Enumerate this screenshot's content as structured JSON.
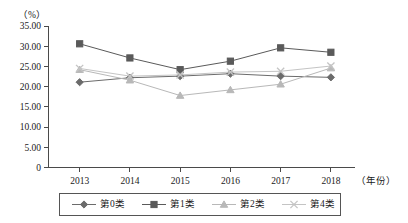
{
  "chart_data": {
    "type": "line",
    "title": "",
    "xlabel": "(年份)",
    "ylabel": "（%）",
    "categories": [
      "2013",
      "2014",
      "2015",
      "2016",
      "2017",
      "2018"
    ],
    "ylim": [
      0,
      35
    ],
    "y_ticks": [
      "0",
      "5.00",
      "10.00",
      "15.00",
      "20.00",
      "25.00",
      "30.00",
      "35.00"
    ],
    "y_tick_values": [
      0,
      5,
      10,
      15,
      20,
      25,
      30,
      35
    ],
    "grid": false,
    "legend_position": "bottom",
    "series": [
      {
        "name": "第0类",
        "marker": "diamond",
        "color": "#6b6b6b",
        "values": [
          21.1,
          22.2,
          22.6,
          23.2,
          22.6,
          22.3
        ]
      },
      {
        "name": "第1类",
        "marker": "square",
        "color": "#5a5a5a",
        "values": [
          30.6,
          27.1,
          24.2,
          26.3,
          29.6,
          28.5
        ]
      },
      {
        "name": "第2类",
        "marker": "triangle",
        "color": "#b8b8b8",
        "values": [
          24.2,
          21.6,
          17.8,
          19.2,
          20.6,
          24.6
        ]
      },
      {
        "name": "第4类",
        "marker": "cross",
        "color": "#c4c4c4",
        "values": [
          24.5,
          22.6,
          22.9,
          23.6,
          23.8,
          25.1
        ]
      }
    ]
  },
  "axis": {
    "y_unit_label": "（%）",
    "x_unit_label": "（年份）"
  }
}
